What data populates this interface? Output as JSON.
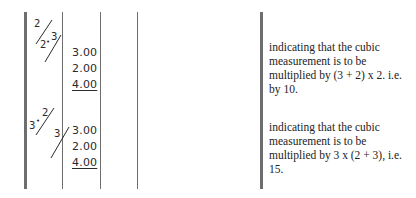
{
  "table": {
    "rows": [
      {
        "notation": {
          "top": "2",
          "left": "2",
          "dot": "•",
          "right": "3"
        },
        "values": [
          "3.00",
          "2.00",
          "4.00"
        ],
        "description_lines": [
          "indicating that the cubic",
          "measurement is to be",
          "multiplied by (3 + 2) x 2.  i.e.",
          "by 10."
        ]
      },
      {
        "notation": {
          "top": "2",
          "left": "3",
          "dot": "•",
          "right": "3"
        },
        "values": [
          "3.00",
          "2.00",
          "4.00"
        ],
        "description_lines": [
          "indicating that the cubic",
          "measurement is to be",
          "multiplied by 3 x (2 + 3), i.e.",
          "15."
        ]
      }
    ]
  },
  "colors": {
    "rule": "#6e6e6e",
    "text": "#222222"
  }
}
